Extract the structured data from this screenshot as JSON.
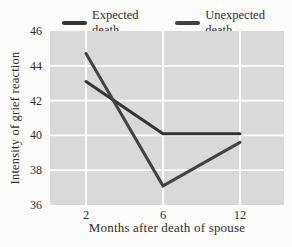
{
  "figure": {
    "legend_items": [
      "Expected death",
      "Unexpected death"
    ]
  },
  "chart_data": {
    "type": "line",
    "title": "",
    "categories": [
      "2",
      "6",
      "12"
    ],
    "series": [
      {
        "name": "Expected death",
        "values": [
          43.1,
          40.1,
          40.1
        ],
        "color": "#343434"
      },
      {
        "name": "Unexpected death",
        "values": [
          44.7,
          37.1,
          39.6
        ],
        "color": "#424242"
      }
    ],
    "xlabel": "Months after death of spouse",
    "ylabel": "Intensity of grief reaction",
    "ylim": [
      36,
      46
    ],
    "yticks": [
      36,
      38,
      40,
      42,
      44,
      46
    ],
    "grid": true,
    "legend_position": "top",
    "plot_background": "#d9d9d9",
    "gridline_color": "#ffffff",
    "text_color": "#2e2e2e"
  }
}
